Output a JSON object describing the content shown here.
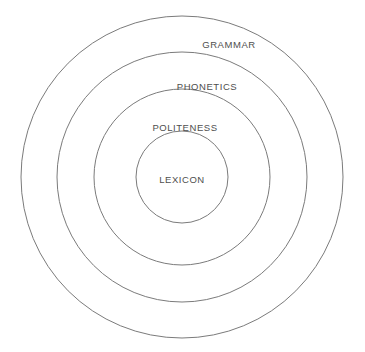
{
  "diagram": {
    "type": "concentric-circles",
    "background_color": "#ffffff",
    "stroke_color": "#7b7b7b",
    "text_color": "#4e4e4e",
    "center": {
      "x": 182,
      "y": 177
    },
    "layers": [
      {
        "id": "grammar",
        "label": "GRAMMAR",
        "level": 1,
        "radius": 161,
        "label_x": 229,
        "label_y": 45
      },
      {
        "id": "phonetics",
        "label": "PHONETICS",
        "level": 2,
        "radius": 125,
        "label_x": 207,
        "label_y": 87
      },
      {
        "id": "politeness",
        "label": "POLITENESS",
        "level": 3,
        "radius": 88,
        "label_x": 185,
        "label_y": 128
      },
      {
        "id": "lexicon",
        "label": "LEXICON",
        "level": 4,
        "radius": 46,
        "label_x": 182,
        "label_y": 180
      }
    ]
  },
  "chart_data": {
    "type": "diagram",
    "subtype": "concentric-circles",
    "title": "",
    "categories": [
      "GRAMMAR",
      "PHONETICS",
      "POLITENESS",
      "LEXICON"
    ],
    "values": [
      161,
      125,
      88,
      46
    ],
    "ylabel": "radius (px)",
    "xlabel": "",
    "legend": [],
    "grid": false
  }
}
